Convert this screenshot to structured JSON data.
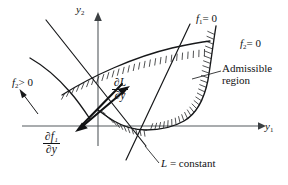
{
  "figure": {
    "type": "diagram",
    "background_color": "#ffffff",
    "ink_color": "#111214",
    "axis_color": "#555a5e"
  },
  "axes": {
    "x_axis": {
      "name": "horizontal-axis",
      "label": "y",
      "subscript": "1",
      "origin_px": [
        98,
        126
      ],
      "end_px": [
        262,
        126
      ],
      "arrow": "right"
    },
    "y_axis": {
      "name": "vertical-axis",
      "label": "y",
      "subscript": "2",
      "origin_px": [
        98,
        126
      ],
      "end_px": [
        98,
        14
      ],
      "arrow": "up"
    }
  },
  "labels": {
    "y1": {
      "base": "y",
      "sub": "1"
    },
    "y2": {
      "base": "y",
      "sub": "2"
    },
    "f1_zero": {
      "base": "f",
      "sub": "1",
      "rest": "= 0"
    },
    "f2_zero": {
      "base": "f",
      "sub": "2",
      "rest": "= 0"
    },
    "f2_positive": {
      "base": "f",
      "sub": "2",
      "rest": "> 0"
    },
    "admissible_region": "Admissible region",
    "dL_dy": {
      "numerator": "∂L",
      "denominator": "∂y"
    },
    "df1_dy": {
      "numerator": "∂f₁",
      "denominator": "∂y"
    },
    "L_constant": "L = constant"
  },
  "curves": [
    {
      "name": "upper-boundary-f2-zero",
      "description": "Upper concave curve rising left-to-right, hatched on underside",
      "hatch_side": "below",
      "label_ref": "f2_zero"
    },
    {
      "name": "right-boundary-f1-zero",
      "description": "Right boundary descending from top-right, curving left into the valley, hatched on outer side",
      "hatch_side": "outside",
      "label_ref": "f1_zero"
    },
    {
      "name": "lower-boundary",
      "description": "Lower valley curve dipping below the horizontal axis, hatched on underside",
      "hatch_side": "below"
    },
    {
      "name": "L-constant-line",
      "description": "Straight line from upper-left to lower-right representing a level set of L",
      "label_ref": "L_constant"
    },
    {
      "name": "second-constraint-line",
      "description": "Second straight line through the intersection cluster",
      "label_ref": "f1_zero"
    },
    {
      "name": "f2-positive-curve",
      "description": "Curve in the left exterior region where f2 is positive",
      "label_ref": "f2_positive"
    }
  ],
  "vectors": [
    {
      "name": "gradient-L-vector",
      "label_ref": "dL_dy",
      "direction": "up-right",
      "from_px": [
        88,
        121
      ],
      "to_px": [
        128,
        88
      ]
    },
    {
      "name": "gradient-f1-vector",
      "label_ref": "df1_dy",
      "direction": "down-left",
      "from_px": [
        118,
        86
      ],
      "to_px": [
        78,
        128
      ]
    },
    {
      "name": "f2-positive-arrow",
      "label_ref": "f2_positive",
      "direction": "up-left",
      "from_px": [
        36,
        112
      ],
      "to_px": [
        19,
        90
      ]
    }
  ],
  "leaders": [
    {
      "name": "admissible-region-leader",
      "from_px": [
        220,
        72
      ],
      "to_px": [
        192,
        80
      ]
    },
    {
      "name": "L-constant-leader",
      "from_px": [
        158,
        162
      ],
      "to_px": [
        144,
        146
      ]
    }
  ]
}
